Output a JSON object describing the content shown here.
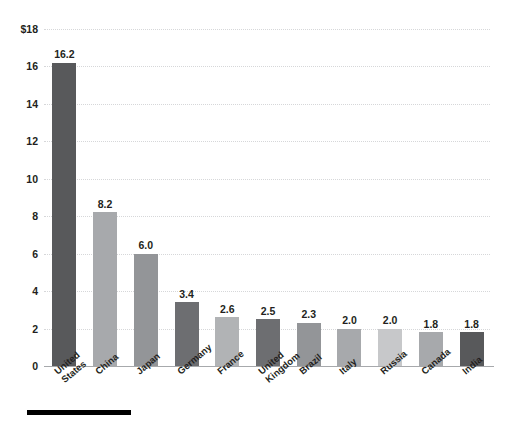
{
  "chart_data": {
    "type": "bar",
    "title": "",
    "subtitle": "",
    "xlabel": "",
    "ylabel": "",
    "ylim": [
      0,
      18
    ],
    "grid": true,
    "legend": "none",
    "y_axis_prefix": "$",
    "y_ticks": [
      "$18",
      "16",
      "14",
      "12",
      "10",
      "8",
      "6",
      "4",
      "2",
      "0"
    ],
    "y_tick_values": [
      18,
      16,
      14,
      12,
      10,
      8,
      6,
      4,
      2,
      0
    ],
    "categories": [
      "United\nStates",
      "China",
      "Japan",
      "Germany",
      "France",
      "United\nKingdom",
      "Brazil",
      "Italy",
      "Russia",
      "Canada",
      "India"
    ],
    "values": [
      16.2,
      8.2,
      6.0,
      3.4,
      2.6,
      2.5,
      2.3,
      2.0,
      2.0,
      1.8,
      1.8
    ],
    "data_labels": [
      "16.2",
      "8.2",
      "6.0",
      "3.4",
      "2.6",
      "2.5",
      "2.3",
      "2.0",
      "2.0",
      "1.8",
      "1.8"
    ],
    "bar_colors": [
      "#58595b",
      "#a7a9ac",
      "#939598",
      "#6d6e71",
      "#b1b3b5",
      "#6d6e71",
      "#939598",
      "#a7a9ac",
      "#c7c8ca",
      "#a7a9ac",
      "#58595b"
    ],
    "gridline_color": "#d6d7d9",
    "axis_line_color": "#a7a9ac",
    "background_color": "#ffffff",
    "text_color": "#231f20"
  },
  "footer": {
    "rule_color": "#000000"
  }
}
